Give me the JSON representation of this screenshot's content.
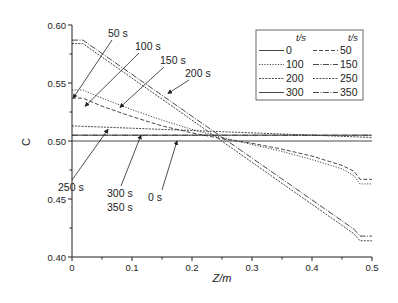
{
  "chart_data": {
    "type": "line",
    "title": "",
    "xlabel": "Z/m",
    "ylabel": "C",
    "xlim": [
      0,
      0.5
    ],
    "ylim": [
      0.4,
      0.6
    ],
    "xticks": [
      "0",
      "0.1",
      "0.2",
      "0.3",
      "0.4",
      "0.5"
    ],
    "yticks": [
      "0.40",
      "0.45",
      "0.50",
      "0.55",
      "0.60"
    ],
    "grid": false,
    "legend": {
      "position": "upper right",
      "header_left": "t/s",
      "header_right": "t/s",
      "entries": [
        "0",
        "50",
        "100",
        "150",
        "200",
        "250",
        "300",
        "350"
      ]
    },
    "series": [
      {
        "name": "0",
        "style": "solid",
        "x": [
          0,
          0.5
        ],
        "y": [
          0.5,
          0.5
        ]
      },
      {
        "name": "50",
        "style": "dashed",
        "x": [
          0,
          0.018,
          0.05,
          0.1,
          0.15,
          0.2,
          0.25,
          0.3,
          0.35,
          0.4,
          0.45,
          0.47,
          0.48,
          0.5
        ],
        "y": [
          0.537,
          0.537,
          0.53,
          0.521,
          0.513,
          0.507,
          0.502,
          0.498,
          0.493,
          0.487,
          0.479,
          0.474,
          0.467,
          0.467
        ]
      },
      {
        "name": "100",
        "style": "dotted",
        "x": [
          0,
          0.018,
          0.05,
          0.1,
          0.15,
          0.2,
          0.25,
          0.3,
          0.35,
          0.4,
          0.45,
          0.47,
          0.48,
          0.5
        ],
        "y": [
          0.544,
          0.544,
          0.537,
          0.527,
          0.518,
          0.51,
          0.503,
          0.497,
          0.491,
          0.484,
          0.476,
          0.47,
          0.463,
          0.463
        ]
      },
      {
        "name": "150",
        "style": "dash-dot",
        "x": [
          0,
          0.018,
          0.47,
          0.48,
          0.5
        ],
        "y": [
          0.587,
          0.587,
          0.424,
          0.418,
          0.418
        ]
      },
      {
        "name": "200",
        "style": "short-dash",
        "x": [
          0,
          0.018,
          0.47,
          0.48,
          0.5
        ],
        "y": [
          0.584,
          0.584,
          0.42,
          0.414,
          0.414
        ]
      },
      {
        "name": "250",
        "style": "short-dash",
        "x": [
          0,
          0.5
        ],
        "y": [
          0.513,
          0.503
        ]
      },
      {
        "name": "300",
        "style": "solid",
        "x": [
          0,
          0.5
        ],
        "y": [
          0.505,
          0.505
        ]
      },
      {
        "name": "350",
        "style": "dash-dot",
        "x": [
          0,
          0.5
        ],
        "y": [
          0.505,
          0.505
        ]
      }
    ],
    "annotations": [
      {
        "text": "50 s",
        "label_x": 108,
        "label_y": 37,
        "tip": [
          0.002,
          0.537
        ]
      },
      {
        "text": "100 s",
        "label_x": 135,
        "label_y": 50,
        "tip": [
          0.022,
          0.53
        ]
      },
      {
        "text": "150 s",
        "label_x": 160,
        "label_y": 64,
        "tip": [
          0.08,
          0.529
        ]
      },
      {
        "text": "200 s",
        "label_x": 185,
        "label_y": 77,
        "tip": [
          0.16,
          0.541
        ]
      },
      {
        "text": "250 s",
        "label_x": 58,
        "label_y": 191,
        "tip": [
          0.06,
          0.51
        ]
      },
      {
        "text": "300 s",
        "label_x": 107,
        "label_y": 197,
        "tip": [
          0.115,
          0.505
        ]
      },
      {
        "text": "350 s",
        "label_x": 107,
        "label_y": 211,
        "tip": null
      },
      {
        "text": "0 s",
        "label_x": 148,
        "label_y": 201,
        "tip": [
          0.175,
          0.5
        ]
      }
    ]
  }
}
